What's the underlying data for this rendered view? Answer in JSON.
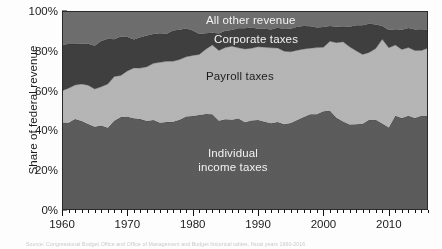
{
  "figure": {
    "background_color": "#fdfdfd",
    "plot_border_color": "#2a2a2a",
    "caption": "Source: Congressional Budget Office and Office of Management and Budget historical tables, fiscal years 1960-2016"
  },
  "axes": {
    "ylabel": "Share of federal revenue",
    "yticks": [
      "0%",
      "20%",
      "40%",
      "60%",
      "80%",
      "100%"
    ],
    "ytick_values": [
      0,
      20,
      40,
      60,
      80,
      100
    ],
    "xticks": [
      "1960",
      "1970",
      "1980",
      "1990",
      "2000",
      "2010"
    ],
    "xtick_values": [
      1960,
      1970,
      1980,
      1990,
      2000,
      2010
    ],
    "xlim": [
      1960,
      2016
    ],
    "ylim": [
      0,
      100
    ],
    "minor_tick_interval_years": 1,
    "grid": false
  },
  "series_labels": [
    {
      "name": "all-other-revenue",
      "text": "All other revenue",
      "color": "#f2f2f2"
    },
    {
      "name": "corporate-taxes",
      "text": "Corporate taxes",
      "color": "#f2f2f2"
    },
    {
      "name": "payroll-taxes",
      "text": "Payroll taxes",
      "color": "#1c1c1c"
    },
    {
      "name": "individual-income-taxes-line1",
      "text": "Individual",
      "color": "#f2f2f2"
    },
    {
      "name": "individual-income-taxes-line2",
      "text": "income taxes",
      "color": "#f2f2f2"
    }
  ],
  "chart_data": {
    "type": "area",
    "stacked": true,
    "normalized_percent": true,
    "title": "",
    "xlabel": "",
    "ylabel": "Share of federal revenue",
    "xlim": [
      1960,
      2016
    ],
    "ylim": [
      0,
      100
    ],
    "grid": false,
    "legend_position": "in-plot-annotations",
    "colors": {
      "individual_income_taxes": "#5c5c5c",
      "payroll_taxes": "#b5b5b5",
      "corporate_taxes": "#3f3f3f",
      "all_other_revenue": "#6e6e6e"
    },
    "x": [
      1960,
      1961,
      1962,
      1963,
      1964,
      1965,
      1966,
      1967,
      1968,
      1969,
      1970,
      1971,
      1972,
      1973,
      1974,
      1975,
      1976,
      1977,
      1978,
      1979,
      1980,
      1981,
      1982,
      1983,
      1984,
      1985,
      1986,
      1987,
      1988,
      1989,
      1990,
      1991,
      1992,
      1993,
      1994,
      1995,
      1996,
      1997,
      1998,
      1999,
      2000,
      2001,
      2002,
      2003,
      2004,
      2005,
      2006,
      2007,
      2008,
      2009,
      2010,
      2011,
      2012,
      2013,
      2014,
      2015,
      2016
    ],
    "series": [
      {
        "name": "Individual income taxes",
        "color": "#5c5c5c",
        "values": [
          44.0,
          43.8,
          45.7,
          44.7,
          43.2,
          41.8,
          42.4,
          41.3,
          44.9,
          46.7,
          46.9,
          46.1,
          45.7,
          44.7,
          45.2,
          43.9,
          44.2,
          44.3,
          45.3,
          47.0,
          47.2,
          47.7,
          48.2,
          48.1,
          44.8,
          45.6,
          45.4,
          46.0,
          44.1,
          45.0,
          45.2,
          44.3,
          43.6,
          44.2,
          43.1,
          43.7,
          45.2,
          46.7,
          48.1,
          48.1,
          49.6,
          49.9,
          46.3,
          44.5,
          43.0,
          43.1,
          43.4,
          45.3,
          45.4,
          43.5,
          41.5,
          47.4,
          46.2,
          47.4,
          46.2,
          47.4,
          47.3
        ]
      },
      {
        "name": "Payroll taxes",
        "color": "#b5b5b5",
        "values": [
          15.9,
          17.4,
          17.1,
          18.6,
          19.5,
          19.0,
          19.5,
          22.0,
          22.2,
          20.9,
          23.0,
          25.3,
          25.6,
          27.3,
          28.5,
          30.3,
          30.5,
          30.5,
          30.3,
          30.0,
          30.5,
          30.5,
          32.6,
          34.8,
          35.4,
          36.1,
          36.9,
          35.5,
          36.8,
          36.3,
          36.8,
          37.5,
          37.9,
          37.2,
          36.7,
          35.8,
          35.1,
          34.2,
          33.2,
          33.5,
          32.2,
          34.9,
          37.8,
          40.0,
          39.0,
          36.9,
          34.8,
          33.9,
          35.7,
          42.3,
          40.0,
          35.5,
          34.5,
          34.2,
          33.9,
          32.8,
          34.1
        ]
      },
      {
        "name": "Corporate taxes",
        "color": "#3f3f3f",
        "values": [
          23.2,
          22.2,
          20.6,
          20.3,
          20.9,
          21.8,
          23.0,
          22.8,
          18.7,
          19.6,
          17.0,
          14.3,
          15.5,
          15.7,
          14.7,
          14.6,
          13.9,
          15.4,
          15.0,
          14.2,
          12.5,
          10.2,
          8.0,
          6.2,
          8.5,
          8.4,
          8.2,
          9.8,
          10.4,
          10.4,
          9.1,
          9.3,
          9.2,
          10.2,
          11.2,
          11.6,
          11.8,
          11.5,
          11.0,
          10.1,
          10.2,
          7.6,
          8.0,
          7.4,
          10.1,
          12.9,
          14.7,
          14.4,
          12.1,
          6.6,
          8.9,
          7.9,
          9.9,
          9.9,
          10.6,
          10.6,
          9.2
        ]
      },
      {
        "name": "All other revenue",
        "color": "#6e6e6e",
        "values": [
          16.9,
          16.6,
          16.6,
          16.4,
          16.4,
          17.4,
          15.1,
          13.9,
          14.2,
          12.8,
          13.1,
          14.3,
          13.2,
          12.3,
          11.6,
          11.2,
          11.4,
          9.8,
          9.4,
          8.8,
          9.8,
          11.6,
          11.2,
          10.9,
          11.3,
          9.9,
          9.5,
          8.7,
          8.7,
          8.3,
          8.9,
          8.9,
          9.3,
          8.4,
          9.0,
          8.9,
          7.9,
          7.6,
          7.7,
          8.3,
          8.0,
          7.6,
          7.9,
          8.1,
          7.9,
          7.1,
          7.1,
          6.4,
          6.8,
          7.6,
          9.6,
          9.2,
          9.4,
          8.5,
          9.3,
          9.2,
          9.4
        ]
      }
    ]
  }
}
